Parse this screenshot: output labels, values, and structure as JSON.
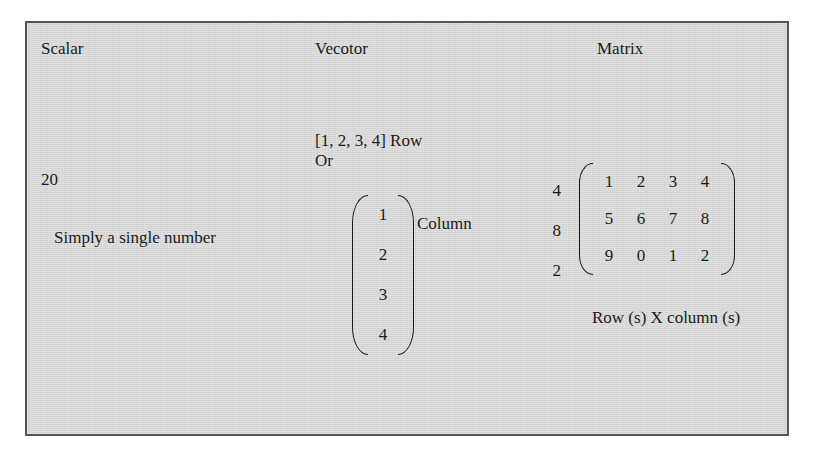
{
  "headings": {
    "scalar": "Scalar",
    "vector": "Vecotor",
    "matrix": "Matrix"
  },
  "scalar": {
    "value": "20",
    "note": "Simply a single number"
  },
  "vector": {
    "row_text": "[1, 2, 3, 4] Row",
    "or_text": "Or",
    "column_entries": [
      "1",
      "2",
      "3",
      "4"
    ],
    "column_label": "Column"
  },
  "matrix": {
    "side_numbers": [
      "4",
      "8",
      "2"
    ],
    "rows": [
      [
        "1",
        "2",
        "3",
        "4"
      ],
      [
        "5",
        "6",
        "7",
        "8"
      ],
      [
        "9",
        "0",
        "1",
        "2"
      ]
    ],
    "caption": "Row (s) X column (s)"
  },
  "colors": {
    "panel_background": "#d8d8d8",
    "panel_border": "#555555",
    "text": "#1a1a1a",
    "page_background": "#ffffff"
  }
}
